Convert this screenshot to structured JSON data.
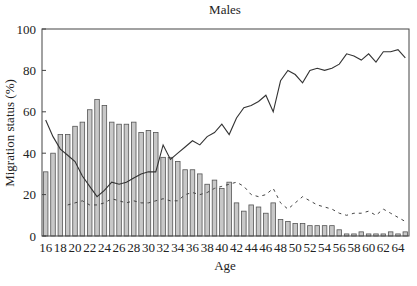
{
  "chart_data": {
    "type": "bar",
    "title": "Males",
    "xlabel": "Age",
    "ylabel": "Migration status (%)",
    "ylim": [
      0,
      100
    ],
    "yticks": [
      0,
      20,
      40,
      60,
      80,
      100
    ],
    "xtick_labels": [
      "16",
      "18",
      "20",
      "22",
      "24",
      "26",
      "28",
      "30",
      "32",
      "34",
      "36",
      "38",
      "40",
      "42",
      "44",
      "46",
      "48",
      "50",
      "52",
      "54",
      "56",
      "58",
      "60",
      "62",
      "64"
    ],
    "grid": false,
    "legend": null,
    "categories": [
      16,
      17,
      18,
      19,
      20,
      21,
      22,
      23,
      24,
      25,
      26,
      27,
      28,
      29,
      30,
      31,
      32,
      33,
      34,
      35,
      36,
      37,
      38,
      39,
      40,
      41,
      42,
      43,
      44,
      45,
      46,
      47,
      48,
      49,
      50,
      51,
      52,
      53,
      54,
      55,
      56,
      57,
      58,
      59,
      60,
      61,
      62,
      63,
      64,
      65
    ],
    "series": [
      {
        "name": "bars",
        "type": "bar",
        "color": "#c8c8c8",
        "values": [
          31,
          40,
          49,
          49,
          53,
          55,
          61,
          66,
          63,
          55,
          54,
          54,
          55,
          50,
          51,
          50,
          38,
          38,
          36,
          32,
          32,
          30,
          25,
          27,
          23,
          26,
          16,
          12,
          15,
          14,
          11,
          16,
          8,
          7,
          6,
          6,
          5,
          5,
          5,
          5,
          3,
          1,
          1,
          2,
          1,
          1,
          1,
          2,
          1,
          2
        ]
      },
      {
        "name": "solid line",
        "type": "line",
        "style": "solid",
        "color": "#333333",
        "values": [
          56,
          48,
          42,
          39,
          36,
          29,
          24,
          19,
          22,
          26,
          25,
          26,
          28,
          30,
          31,
          31,
          44,
          37,
          40,
          43,
          46,
          44,
          48,
          50,
          54,
          49,
          57,
          62,
          63,
          65,
          68,
          60,
          75,
          80,
          78,
          74,
          80,
          81,
          80,
          81,
          83,
          88,
          87,
          85,
          88,
          84,
          89,
          89,
          90,
          86
        ]
      },
      {
        "name": "dashed line",
        "type": "line",
        "style": "dashed",
        "color": "#444444",
        "values": [
          null,
          null,
          null,
          15,
          16,
          17,
          15,
          15,
          16,
          18,
          17,
          16,
          17,
          16,
          16,
          17,
          18,
          17,
          17,
          20,
          21,
          20,
          21,
          23,
          24,
          25,
          26,
          24,
          20,
          19,
          20,
          23,
          16,
          13,
          16,
          19,
          17,
          15,
          14,
          13,
          11,
          10,
          11,
          11,
          12,
          10,
          13,
          11,
          9,
          7
        ]
      }
    ]
  }
}
